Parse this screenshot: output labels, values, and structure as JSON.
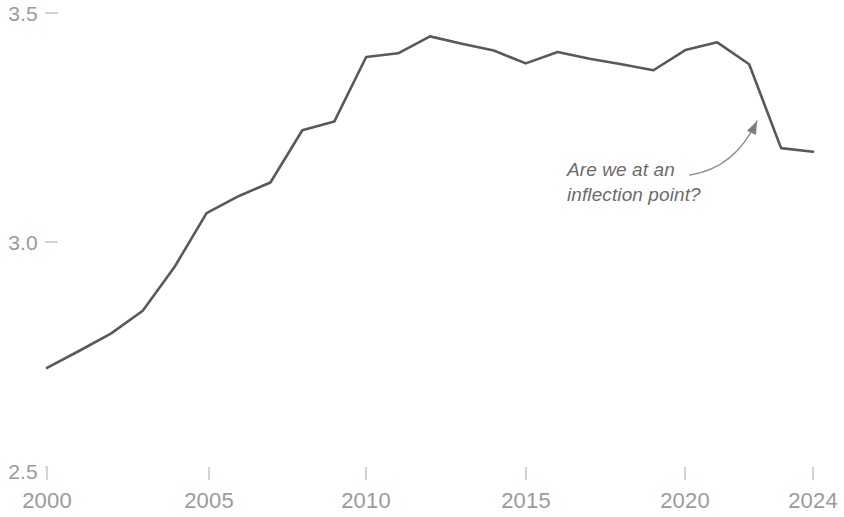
{
  "chart_data": {
    "type": "line",
    "title": "",
    "subtitle": "",
    "xlabel": "",
    "ylabel": "",
    "xlim": [
      2000,
      2024
    ],
    "ylim": [
      2.5,
      3.5
    ],
    "grid": false,
    "legend": "none",
    "x_ticks": [
      "2000",
      "2005",
      "2010",
      "2015",
      "2020",
      "2024"
    ],
    "x_tick_values": [
      2000,
      2005,
      2010,
      2015,
      2020,
      2024
    ],
    "y_ticks": [
      "2.5",
      "3.0",
      "3.5"
    ],
    "y_tick_values": [
      2.5,
      3.0,
      3.5
    ],
    "line_color": "#595959",
    "line_width": 2.6,
    "axis_color": "#c8c8c8",
    "tick_label_color": "#9b9b9b",
    "annotation_color": "#6b6b6b",
    "series": [
      {
        "name": "value",
        "x": [
          2000,
          2001,
          2002,
          2003,
          2004,
          2005,
          2006,
          2007,
          2008,
          2009,
          2010,
          2011,
          2012,
          2013,
          2014,
          2015,
          2016,
          2017,
          2018,
          2019,
          2020,
          2021,
          2022,
          2023,
          2024
        ],
        "values": [
          2.725,
          2.762,
          2.8,
          2.85,
          2.946,
          3.063,
          3.1,
          3.13,
          3.244,
          3.263,
          3.404,
          3.412,
          3.449,
          3.433,
          3.418,
          3.39,
          3.415,
          3.4,
          3.388,
          3.375,
          3.419,
          3.436,
          3.388,
          3.205,
          3.197
        ]
      }
    ],
    "annotations": [
      {
        "name": "inflection-note",
        "text_lines": [
          "Are we at an",
          "inflection point?"
        ],
        "text_x": 567,
        "text_y": 157,
        "arrow": {
          "tail_x": 690,
          "tail_y": 175,
          "control_x": 735,
          "control_y": 168,
          "tip_x": 757,
          "tip_y": 121
        }
      }
    ]
  },
  "axes": {
    "y_tick_labels": [
      {
        "text": "3.5",
        "top": 2,
        "right_edge": 38
      },
      {
        "text": "3.0",
        "top": 231,
        "right_edge": 38
      },
      {
        "text": "2.5",
        "top": 460,
        "right_edge": 38
      }
    ],
    "x_tick_labels": [
      {
        "text": "2000",
        "center": 47,
        "top": 488
      },
      {
        "text": "2005",
        "center": 209,
        "top": 488
      },
      {
        "text": "2010",
        "center": 366,
        "top": 488
      },
      {
        "text": "2015",
        "center": 526,
        "top": 488
      },
      {
        "text": "2020",
        "center": 685,
        "top": 488
      },
      {
        "text": "2024",
        "center": 813,
        "top": 488
      }
    ]
  }
}
